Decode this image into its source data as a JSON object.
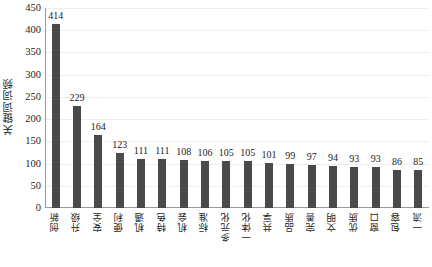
{
  "chart_data": {
    "type": "bar",
    "title": "",
    "subtitle": "",
    "xlabel": "",
    "ylabel": "关键词词频",
    "ylim": [
      0,
      450
    ],
    "ytick_step": 50,
    "yticks": [
      450,
      400,
      350,
      300,
      250,
      200,
      150,
      100,
      50,
      0
    ],
    "grid": true,
    "grid_axis": "y",
    "legend": false,
    "legend_position": "none",
    "bar_color": "#4a4a4a",
    "axis_color": "#9a9a9a",
    "gridline_color": "#eeeeee",
    "text_color": "#1d1d1d",
    "show_data_labels": true,
    "xtick_rotation": 90,
    "categories": [
      "创新",
      "升级",
      "安全",
      "便利",
      "机遇",
      "特色",
      "机会",
      "标准",
      "多元化",
      "一体化",
      "共享",
      "品质",
      "完善",
      "文明",
      "优质",
      "窗口",
      "包容",
      "一流"
    ],
    "values": [
      414,
      229,
      164,
      123,
      111,
      111,
      108,
      106,
      105,
      105,
      101,
      99,
      97,
      94,
      93,
      93,
      86,
      85
    ]
  }
}
